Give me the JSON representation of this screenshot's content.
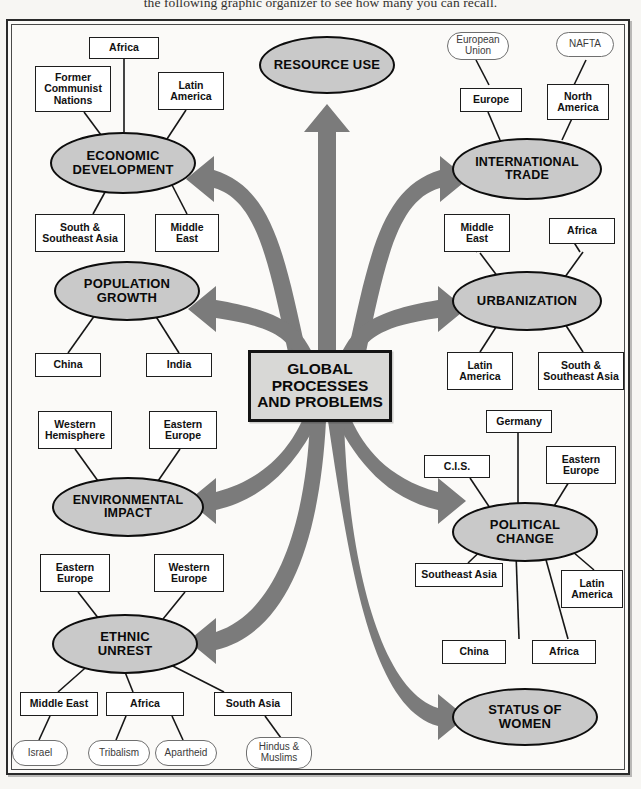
{
  "caption": "the following graphic organizer to see how many you can recall.",
  "colors": {
    "ellipse_fill": "#c9c9c9",
    "ellipse_stroke": "#0d0d0d",
    "arrow_fill": "#7b7b7b",
    "center_fill": "#d8d8d6",
    "box_stroke": "#1d1d1d",
    "pill_stroke": "#6f6f6f",
    "frame_stroke": "#2a2a2a"
  },
  "center": {
    "label": "GLOBAL\nPROCESSES\nAND PROBLEMS"
  },
  "topics": [
    {
      "id": "resource-use",
      "label": "RESOURCE USE",
      "boxes": [],
      "pills": []
    },
    {
      "id": "economic-development",
      "label": "ECONOMIC\nDEVELOPMENT",
      "boxes": [
        "Africa",
        "Former\nCommunist\nNations",
        "Latin\nAmerica",
        "South &\nSoutheast Asia",
        "Middle\nEast"
      ],
      "pills": []
    },
    {
      "id": "international-trade",
      "label": "INTERNATIONAL\nTRADE",
      "boxes": [
        "Europe",
        "North\nAmerica",
        "Middle\nEast",
        "Africa"
      ],
      "pills": [
        "European\nUnion",
        "NAFTA"
      ]
    },
    {
      "id": "population-growth",
      "label": "POPULATION\nGROWTH",
      "boxes": [
        "China",
        "India"
      ],
      "pills": []
    },
    {
      "id": "urbanization",
      "label": "URBANIZATION",
      "boxes": [
        "Middle\nEast",
        "Africa",
        "Latin\nAmerica",
        "South &\nSoutheast Asia"
      ],
      "pills": []
    },
    {
      "id": "environmental-impact",
      "label": "ENVIRONMENTAL\nIMPACT",
      "boxes": [
        "Western\nHemisphere",
        "Eastern\nEurope"
      ],
      "pills": []
    },
    {
      "id": "political-change",
      "label": "POLITICAL\nCHANGE",
      "boxes": [
        "Germany",
        "C.I.S.",
        "Eastern\nEurope",
        "Southeast Asia",
        "China",
        "Africa",
        "Latin\nAmerica"
      ],
      "pills": []
    },
    {
      "id": "ethnic-unrest",
      "label": "ETHNIC\nUNREST",
      "boxes": [
        "Eastern\nEurope",
        "Western\nEurope",
        "Middle East",
        "Africa",
        "South Asia"
      ],
      "pills": [
        "Israel",
        "Tribalism",
        "Apartheid",
        "Hindus &\nMuslims"
      ]
    },
    {
      "id": "status-of-women",
      "label": "STATUS OF\nWOMEN",
      "boxes": [],
      "pills": []
    }
  ],
  "nodes": {
    "resource_use": "RESOURCE USE",
    "economic_development": "ECONOMIC\nDEVELOPMENT",
    "international_trade": "INTERNATIONAL\nTRADE",
    "population_growth": "POPULATION\nGROWTH",
    "urbanization": "URBANIZATION",
    "environmental_impact": "ENVIRONMENTAL\nIMPACT",
    "political_change": "POLITICAL\nCHANGE",
    "ethnic_unrest": "ETHNIC\nUNREST",
    "status_of_women": "STATUS OF\nWOMEN",
    "ed_africa": "Africa",
    "ed_former_communist": "Former\nCommunist\nNations",
    "ed_latin_america": "Latin\nAmerica",
    "ed_south_southeast_asia": "South &\nSoutheast Asia",
    "ed_middle_east": "Middle\nEast",
    "it_european_union": "European\nUnion",
    "it_nafta": "NAFTA",
    "it_europe": "Europe",
    "it_north_america": "North\nAmerica",
    "ur_middle_east": "Middle\nEast",
    "ur_africa": "Africa",
    "ur_latin_america": "Latin\nAmerica",
    "ur_south_southeast_asia": "South &\nSoutheast Asia",
    "pg_china": "China",
    "pg_india": "India",
    "ei_western_hemisphere": "Western\nHemisphere",
    "ei_eastern_europe": "Eastern\nEurope",
    "pc_germany": "Germany",
    "pc_cis": "C.I.S.",
    "pc_eastern_europe": "Eastern\nEurope",
    "pc_southeast_asia": "Southeast Asia",
    "pc_china": "China",
    "pc_africa": "Africa",
    "pc_latin_america": "Latin\nAmerica",
    "eu_eastern_europe": "Eastern\nEurope",
    "eu_western_europe": "Western\nEurope",
    "eu_middle_east": "Middle East",
    "eu_africa": "Africa",
    "eu_south_asia": "South Asia",
    "eu_israel": "Israel",
    "eu_tribalism": "Tribalism",
    "eu_apartheid": "Apartheid",
    "eu_hindus_muslims": "Hindus &\nMuslims"
  }
}
